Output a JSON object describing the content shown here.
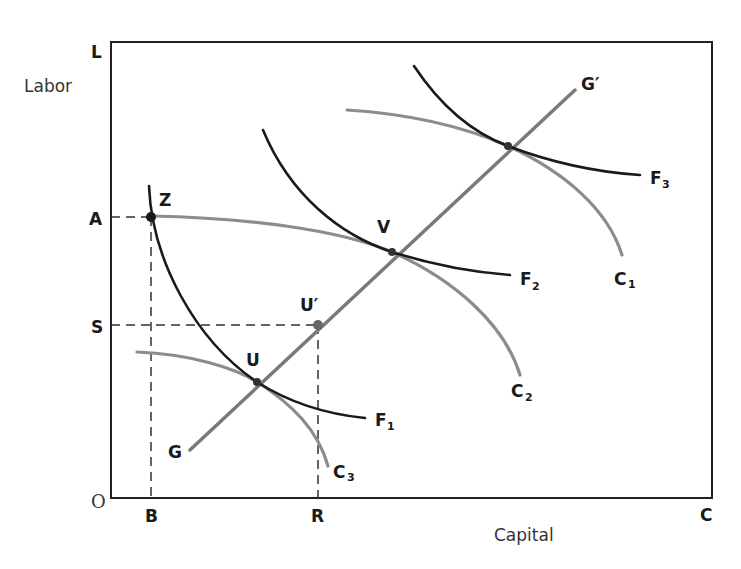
{
  "diagram": {
    "y_axis_title": "Labor",
    "x_axis_title": "Capital",
    "corner_labels": {
      "top_left": "L",
      "bottom_right": "C",
      "origin": "O"
    },
    "y_ticks": [
      {
        "label": "A",
        "y": 217
      },
      {
        "label": "S",
        "y": 325
      }
    ],
    "x_ticks": [
      {
        "label": "B",
        "x": 151
      },
      {
        "label": "R",
        "x": 318
      }
    ],
    "points": [
      {
        "label": "Z",
        "x": 151,
        "y": 217
      },
      {
        "label": "U",
        "x": 257,
        "y": 382
      },
      {
        "label": "U′",
        "x": 318,
        "y": 325
      },
      {
        "label": "V",
        "x": 392,
        "y": 252
      },
      {
        "label": "",
        "x": 508,
        "y": 146
      }
    ],
    "lines": [
      {
        "label": "G",
        "end_label": "G′",
        "type": "straight"
      }
    ],
    "curves": [
      {
        "name": "F",
        "subscript": "1",
        "kind": "isoquant"
      },
      {
        "name": "F",
        "subscript": "2",
        "kind": "isoquant"
      },
      {
        "name": "F",
        "subscript": "3",
        "kind": "isoquant"
      },
      {
        "name": "C",
        "subscript": "1",
        "kind": "isoquant"
      },
      {
        "name": "C",
        "subscript": "2",
        "kind": "isoquant"
      },
      {
        "name": "C",
        "subscript": "3",
        "kind": "isoquant"
      }
    ],
    "colors": {
      "dark_curve": "#1a1a1a",
      "gray_curve": "#8c8c8c",
      "axis": "#222222"
    }
  }
}
